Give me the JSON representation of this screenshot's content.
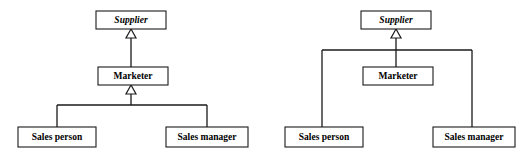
{
  "figure": {
    "kind": "uml-class-diagram-pair",
    "background_color": "#ffffff",
    "line_color": "#1a1a1a",
    "box_fill": "#ffffff",
    "text_color": "#000000"
  },
  "diagrams": [
    {
      "id": "left",
      "name": "multi-level-generalization",
      "classes": [
        {
          "id": "supplier",
          "label": "Supplier",
          "abstract": true,
          "x": 96,
          "y": 11,
          "w": 70,
          "h": 18
        },
        {
          "id": "marketer",
          "label": "Marketer",
          "abstract": false,
          "x": 98,
          "y": 67,
          "w": 70,
          "h": 18
        },
        {
          "id": "sales_person",
          "label": "Sales person",
          "abstract": false,
          "x": 18,
          "y": 127,
          "w": 78,
          "h": 20
        },
        {
          "id": "sales_manager",
          "label": "Sales manager",
          "abstract": false,
          "x": 166,
          "y": 127,
          "w": 82,
          "h": 20
        }
      ],
      "generalizations": [
        {
          "from": "marketer",
          "to": "supplier"
        },
        {
          "from": "sales_person",
          "to": "marketer"
        },
        {
          "from": "sales_manager",
          "to": "marketer"
        }
      ],
      "branch_line_y": 105
    },
    {
      "id": "right",
      "name": "flat-generalization",
      "classes": [
        {
          "id": "supplier",
          "label": "Supplier",
          "abstract": true,
          "x": 361,
          "y": 11,
          "w": 70,
          "h": 18
        },
        {
          "id": "marketer",
          "label": "Marketer",
          "abstract": false,
          "x": 363,
          "y": 67,
          "w": 70,
          "h": 18
        },
        {
          "id": "sales_person",
          "label": "Sales person",
          "abstract": false,
          "x": 285,
          "y": 127,
          "w": 78,
          "h": 20
        },
        {
          "id": "sales_manager",
          "label": "Sales manager",
          "abstract": false,
          "x": 433,
          "y": 127,
          "w": 82,
          "h": 20
        }
      ],
      "generalizations": [
        {
          "from": "marketer",
          "to": "supplier"
        },
        {
          "from": "sales_person",
          "to": "supplier"
        },
        {
          "from": "sales_manager",
          "to": "supplier"
        }
      ],
      "branch_line_y": 50
    }
  ],
  "labels": {
    "supplier": "Supplier",
    "marketer": "Marketer",
    "sales_person": "Sales person",
    "sales_manager": "Sales manager"
  }
}
